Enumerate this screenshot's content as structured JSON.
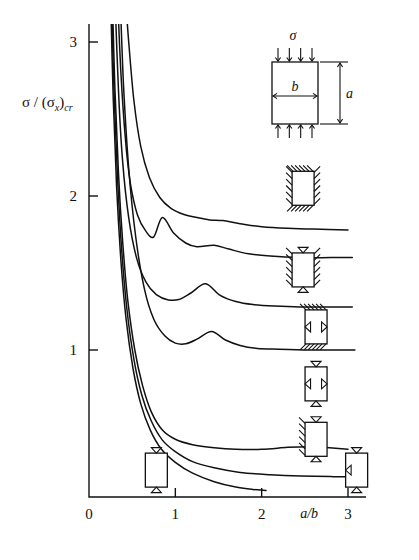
{
  "figure": {
    "name": "plate-buckling-coefficient-chart",
    "background": "#ffffff",
    "ink": "#111111"
  },
  "chart_data": {
    "type": "line",
    "title": "",
    "xlabel": "a/b",
    "ylabel": "σ / (σ_x)_cr",
    "xlim": [
      0,
      3.2
    ],
    "ylim": [
      0,
      3.2
    ],
    "xticks": [
      0,
      1,
      2,
      3
    ],
    "xticklabels": [
      "0",
      "1",
      "2",
      "3"
    ],
    "yticks": [
      1,
      2,
      3
    ],
    "yticklabels": [
      "1",
      "2",
      "3"
    ],
    "grid": false,
    "legend": "inline boundary-condition plate icons beside each curve",
    "inset": {
      "name": "plate-loading-sketch",
      "stress_symbol": "σ",
      "width_label": "b",
      "height_label": "a",
      "description": "rectangular plate of width b and height a under uniform edge compression σ on top and bottom edges"
    },
    "series": [
      {
        "name": "all-edges-clamped",
        "edge_conditions": {
          "top": "clamped",
          "bottom": "clamped",
          "left": "clamped",
          "right": "clamped"
        },
        "asymptote": 1.78,
        "points": [
          [
            0.42,
            3.3
          ],
          [
            0.46,
            3.0
          ],
          [
            0.52,
            2.62
          ],
          [
            0.6,
            2.32
          ],
          [
            0.7,
            2.12
          ],
          [
            0.82,
            1.99
          ],
          [
            0.95,
            1.92
          ],
          [
            1.1,
            1.88
          ],
          [
            1.25,
            1.86
          ],
          [
            1.4,
            1.845
          ],
          [
            1.55,
            1.84
          ],
          [
            1.75,
            1.82
          ],
          [
            2.0,
            1.8
          ],
          [
            2.3,
            1.79
          ],
          [
            2.6,
            1.785
          ],
          [
            3.0,
            1.78
          ]
        ]
      },
      {
        "name": "sides-clamped-ends-simply-supported",
        "edge_conditions": {
          "top": "simply-supported",
          "bottom": "simply-supported",
          "left": "clamped",
          "right": "clamped"
        },
        "asymptote": 1.6,
        "cusps": [
          [
            0.85,
            1.86
          ],
          [
            1.45,
            1.68
          ]
        ],
        "points": [
          [
            0.33,
            3.3
          ],
          [
            0.37,
            2.8
          ],
          [
            0.42,
            2.38
          ],
          [
            0.48,
            2.08
          ],
          [
            0.56,
            1.88
          ],
          [
            0.66,
            1.77
          ],
          [
            0.75,
            1.735
          ],
          [
            0.85,
            1.86
          ],
          [
            0.98,
            1.76
          ],
          [
            1.12,
            1.695
          ],
          [
            1.25,
            1.67
          ],
          [
            1.45,
            1.68
          ],
          [
            1.62,
            1.655
          ],
          [
            1.85,
            1.625
          ],
          [
            2.1,
            1.61
          ],
          [
            2.45,
            1.6
          ],
          [
            2.8,
            1.6
          ],
          [
            3.05,
            1.6
          ]
        ]
      },
      {
        "name": "ends-clamped-sides-simply-supported",
        "edge_conditions": {
          "top": "clamped",
          "bottom": "clamped",
          "left": "simply-supported",
          "right": "simply-supported"
        },
        "asymptote": 1.28,
        "cusps": [
          [
            1.35,
            1.43
          ]
        ],
        "points": [
          [
            0.3,
            3.3
          ],
          [
            0.34,
            2.7
          ],
          [
            0.39,
            2.22
          ],
          [
            0.46,
            1.86
          ],
          [
            0.55,
            1.6
          ],
          [
            0.66,
            1.44
          ],
          [
            0.78,
            1.36
          ],
          [
            0.92,
            1.325
          ],
          [
            1.05,
            1.33
          ],
          [
            1.18,
            1.37
          ],
          [
            1.35,
            1.43
          ],
          [
            1.52,
            1.355
          ],
          [
            1.7,
            1.315
          ],
          [
            1.9,
            1.295
          ],
          [
            2.15,
            1.285
          ],
          [
            2.45,
            1.28
          ],
          [
            2.8,
            1.28
          ],
          [
            3.05,
            1.28
          ]
        ]
      },
      {
        "name": "all-edges-simply-supported",
        "edge_conditions": {
          "top": "simply-supported",
          "bottom": "simply-supported",
          "left": "simply-supported",
          "right": "simply-supported"
        },
        "asymptote": 1.0,
        "cusps": [
          [
            1.42,
            1.12
          ]
        ],
        "points": [
          [
            0.36,
            3.3
          ],
          [
            0.4,
            2.72
          ],
          [
            0.46,
            2.18
          ],
          [
            0.54,
            1.74
          ],
          [
            0.64,
            1.4
          ],
          [
            0.75,
            1.2
          ],
          [
            0.88,
            1.09
          ],
          [
            1.0,
            1.045
          ],
          [
            1.12,
            1.04
          ],
          [
            1.25,
            1.07
          ],
          [
            1.42,
            1.12
          ],
          [
            1.58,
            1.065
          ],
          [
            1.75,
            1.03
          ],
          [
            1.95,
            1.01
          ],
          [
            2.2,
            1.005
          ],
          [
            2.55,
            1.0
          ],
          [
            2.9,
            1.0
          ],
          [
            3.08,
            1.0
          ]
        ]
      },
      {
        "name": "one-side-clamped-others-simply-supported",
        "edge_conditions": {
          "top": "simply-supported",
          "bottom": "simply-supported",
          "left": "clamped",
          "right": "free"
        },
        "asymptote": 0.37,
        "points": [
          [
            0.27,
            3.3
          ],
          [
            0.3,
            2.7
          ],
          [
            0.34,
            2.16
          ],
          [
            0.39,
            1.7
          ],
          [
            0.45,
            1.32
          ],
          [
            0.53,
            1.0
          ],
          [
            0.62,
            0.77
          ],
          [
            0.72,
            0.6
          ],
          [
            0.85,
            0.48
          ],
          [
            1.0,
            0.42
          ],
          [
            1.2,
            0.385
          ],
          [
            1.45,
            0.365
          ],
          [
            1.7,
            0.355
          ],
          [
            2.0,
            0.355
          ],
          [
            2.3,
            0.368
          ],
          [
            2.55,
            0.372
          ],
          [
            2.75,
            0.366
          ],
          [
            3.0,
            0.355
          ]
        ]
      },
      {
        "name": "ends-simply-supported-sides-free",
        "edge_conditions": {
          "top": "simply-supported",
          "bottom": "simply-supported",
          "left": "free",
          "right": "free"
        },
        "asymptote": 0.18,
        "points": [
          [
            0.26,
            3.3
          ],
          [
            0.29,
            2.68
          ],
          [
            0.33,
            2.12
          ],
          [
            0.38,
            1.64
          ],
          [
            0.44,
            1.26
          ],
          [
            0.52,
            0.94
          ],
          [
            0.61,
            0.71
          ],
          [
            0.72,
            0.54
          ],
          [
            0.85,
            0.415
          ],
          [
            1.0,
            0.34
          ],
          [
            1.2,
            0.275
          ],
          [
            1.45,
            0.235
          ],
          [
            1.75,
            0.205
          ],
          [
            2.1,
            0.19
          ],
          [
            2.45,
            0.182
          ],
          [
            2.8,
            0.178
          ],
          [
            3.05,
            0.177
          ]
        ]
      },
      {
        "name": "simply-supported-one-edge-free",
        "edge_conditions": {
          "top": "simply-supported",
          "bottom": "simply-supported",
          "left": "simply-supported",
          "right": "free"
        },
        "asymptote": 0.05,
        "truncated_at_x": 2.05,
        "points": [
          [
            0.25,
            3.3
          ],
          [
            0.28,
            2.64
          ],
          [
            0.32,
            2.06
          ],
          [
            0.37,
            1.58
          ],
          [
            0.43,
            1.2
          ],
          [
            0.51,
            0.88
          ],
          [
            0.6,
            0.65
          ],
          [
            0.71,
            0.48
          ],
          [
            0.84,
            0.355
          ],
          [
            1.0,
            0.27
          ],
          [
            1.2,
            0.2
          ],
          [
            1.45,
            0.145
          ],
          [
            1.7,
            0.11
          ],
          [
            1.9,
            0.095
          ],
          [
            2.05,
            0.088
          ]
        ]
      }
    ],
    "icons": [
      {
        "name": "icon-all-clamped",
        "label_x": 2.48,
        "label_y": 2.05,
        "top": "clamped",
        "bottom": "clamped",
        "left": "clamped",
        "right": "clamped"
      },
      {
        "name": "icon-sides-clamped",
        "label_x": 2.48,
        "label_y": 1.52,
        "top": "simply-supported",
        "bottom": "simply-supported",
        "left": "clamped",
        "right": "clamped"
      },
      {
        "name": "icon-ends-clamped",
        "label_x": 2.63,
        "label_y": 1.15,
        "top": "clamped",
        "bottom": "clamped",
        "left": "simply-supported",
        "right": "simply-supported"
      },
      {
        "name": "icon-all-simply-supported",
        "label_x": 2.63,
        "label_y": 0.78,
        "top": "simply-supported",
        "bottom": "simply-supported",
        "left": "simply-supported",
        "right": "simply-supported"
      },
      {
        "name": "icon-one-side-clamped",
        "label_x": 2.63,
        "label_y": 0.42,
        "top": "simply-supported",
        "bottom": "simply-supported",
        "left": "clamped",
        "right": "free"
      },
      {
        "name": "icon-sides-free",
        "label_x": 0.78,
        "label_y": 0.22,
        "top": "simply-supported",
        "bottom": "simply-supported",
        "left": "free",
        "right": "free"
      },
      {
        "name": "icon-one-edge-free",
        "label_x": 3.1,
        "label_y": 0.22,
        "top": "simply-supported",
        "bottom": "simply-supported",
        "left": "simply-supported",
        "right": "free"
      }
    ]
  }
}
